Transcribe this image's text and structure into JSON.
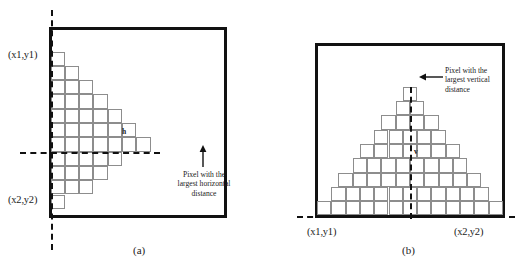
{
  "figure": {
    "panel_a": {
      "caption": "(a)",
      "corner_top_label": "(x1,y1)",
      "corner_bottom_label": "(x2,y2)",
      "distance_label": "h",
      "annotation_line1": "Pixel with the",
      "annotation_line2": "largest horizontal",
      "annotation_line3": "distance",
      "shape_description": "sideways triangle of pixels widest at the horizontal dashed line",
      "row_count": 11,
      "row_widths": [
        1,
        2,
        3,
        4,
        5,
        6,
        7,
        5,
        4,
        3,
        1
      ],
      "dashed_line_orientation": "horizontal",
      "arrow_direction": "up"
    },
    "panel_b": {
      "caption": "(b)",
      "corner_left_label": "(x1,y1)",
      "corner_right_label": "(x2,y2)",
      "distance_label": "v",
      "annotation_line1": "Pixel with the",
      "annotation_line2": "largest vertical",
      "annotation_line3": "distance",
      "shape_description": "pyramid of pixels tallest at the vertical dashed line",
      "row_count": 9,
      "row_widths": [
        1,
        2,
        4,
        5,
        7,
        8,
        10,
        11,
        13
      ],
      "dashed_line_orientation": "vertical",
      "arrow_direction": "left"
    },
    "colors": {
      "border": "#111111",
      "cell_stroke": "#8d8d8d",
      "dash": "#111111",
      "background": "#ffffff",
      "text": "#1a1a1a"
    }
  }
}
